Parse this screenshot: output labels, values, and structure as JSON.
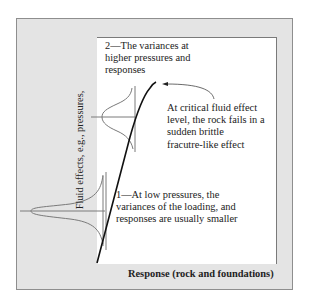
{
  "diagram": {
    "axes": {
      "y_label": "Fluid effects, e.g., pressures,",
      "x_label": "Response (rock and foundations)"
    },
    "annotations": {
      "high": {
        "line1": "2—The variances at",
        "line2": "higher pressures and",
        "line3": "responses"
      },
      "critical": {
        "line1": "At critical fluid effect",
        "line2": "level, the rock fails in a",
        "line3": "sudden brittle",
        "line4": "fracutre-like effect"
      },
      "low": {
        "line1": "1—At low pressures, the",
        "line2": "variances of the loading, and",
        "line3": "responses are usually smaller"
      }
    },
    "colors": {
      "frame_fill": "#e4e4e4",
      "frame_border": "#8e8e8e",
      "plot_fill": "#ffffff",
      "curve": "#111111",
      "distribution": "#777777"
    }
  }
}
